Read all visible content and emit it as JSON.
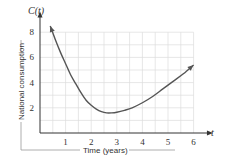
{
  "chart_data": {
    "type": "line",
    "title": "",
    "xlabel": "Time (years)",
    "ylabel": "National consumption",
    "x_axis_name": "t",
    "y_axis_name": "C(t)",
    "xlim": [
      0,
      6.6
    ],
    "ylim": [
      0,
      9
    ],
    "xticks": [
      1,
      2,
      3,
      4,
      5,
      6
    ],
    "yticks": [
      2,
      4,
      6,
      8
    ],
    "grid": true,
    "grid_step": {
      "x": 0.5,
      "y": 1
    },
    "series": [
      {
        "name": "C(t)",
        "color": "#555555",
        "x": [
          0.4,
          0.6,
          0.8,
          1.0,
          1.2,
          1.4,
          1.6,
          1.8,
          2.0,
          2.2,
          2.4,
          2.6,
          2.8,
          3.0,
          3.3,
          3.6,
          4.0,
          4.4,
          4.8,
          5.2,
          5.6,
          6.0
        ],
        "y": [
          8.5,
          7.4,
          6.4,
          5.5,
          4.6,
          3.9,
          3.2,
          2.6,
          2.2,
          1.9,
          1.7,
          1.6,
          1.6,
          1.65,
          1.8,
          2.0,
          2.4,
          2.9,
          3.5,
          4.1,
          4.7,
          5.4
        ]
      }
    ],
    "arrows": "both-ends"
  }
}
